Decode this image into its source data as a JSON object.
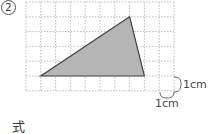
{
  "problem": {
    "number": "2",
    "answer_label": "式"
  },
  "grid": {
    "origin_x": 26,
    "origin_y": 2,
    "cell_px": 14.8,
    "columns": 10,
    "rows": 6,
    "line_color": "#bbbbbb"
  },
  "triangle": {
    "vertices_grid": [
      [
        1,
        5
      ],
      [
        8,
        5
      ],
      [
        7,
        1
      ]
    ],
    "fill": "#b5b5b5",
    "stroke": "#444444"
  },
  "scale": {
    "vertical_label": "1cm",
    "horizontal_label": "1cm"
  }
}
